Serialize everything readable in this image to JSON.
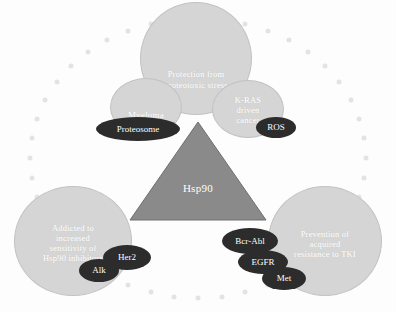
{
  "figure": {
    "colors": {
      "bubble_fill": "#d5d5d5",
      "bubble_stroke": "#c2c2c2",
      "pill_fill": "#2c2c2c",
      "triangle_fill": "#8a8a8a",
      "triangle_stroke": "#6f6f6f",
      "ring_dot": "#e3e3e3",
      "bubble_text": "#ffffff",
      "pill_text": "#ffffff",
      "background": "#fdfdfd"
    }
  },
  "center": {
    "label": "Hsp90"
  },
  "bubbles": [
    {
      "id": "protection",
      "label": "Protection from\nproteotoxic stress"
    },
    {
      "id": "myeloma",
      "label": "Myeloma"
    },
    {
      "id": "kras",
      "label": "K-RAS\ndriven\ncancer"
    },
    {
      "id": "addicted",
      "label": "Addicted to\nincreased\nsensitivity of\nHsp90 inhibitors"
    },
    {
      "id": "prevention",
      "label": "Prevention of\nacquired\nresistance to TKI"
    }
  ],
  "pills": [
    {
      "id": "proteosome",
      "label": "Proteosome"
    },
    {
      "id": "ros",
      "label": "ROS"
    },
    {
      "id": "her2",
      "label": "Her2"
    },
    {
      "id": "alk",
      "label": "Alk"
    },
    {
      "id": "bcrabl",
      "label": "Bcr-Abl"
    },
    {
      "id": "egfr",
      "label": "EGFR"
    },
    {
      "id": "met",
      "label": "Met"
    }
  ],
  "ring": {
    "dot_count": 44,
    "center_x": 198,
    "center_y": 158,
    "radius_x": 168,
    "radius_y": 140
  }
}
